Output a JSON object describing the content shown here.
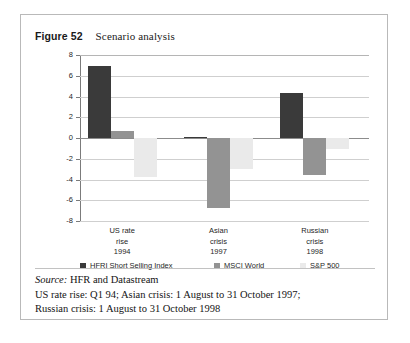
{
  "figure": {
    "label": "Figure 52",
    "title": "Scenario analysis"
  },
  "chart_data": {
    "type": "bar",
    "title": "Scenario analysis",
    "xlabel": "",
    "ylabel": "Three-month total return (%)",
    "ylim": [
      -8,
      8
    ],
    "yticks": [
      "8",
      "6",
      "4",
      "2",
      "0",
      "-2",
      "-4",
      "-6",
      "-8"
    ],
    "ytick_values": [
      8,
      6,
      4,
      2,
      0,
      -2,
      -4,
      -6,
      -8
    ],
    "grid": true,
    "legend_position": "bottom",
    "categories": [
      "US rate rise 1994",
      "Asian crisis 1997",
      "Russian crisis 1998"
    ],
    "category_lines": [
      [
        "US rate",
        "rise",
        "1994"
      ],
      [
        "Asian",
        "crisis",
        "1997"
      ],
      [
        "Russian",
        "crisis",
        "1998"
      ]
    ],
    "series": [
      {
        "name": "HFRI Short Selling Index",
        "color": "#3a3a3a",
        "values": [
          6.9,
          0.1,
          4.3
        ]
      },
      {
        "name": "MSCI World",
        "color": "#939393",
        "values": [
          0.7,
          -6.7,
          -3.6
        ]
      },
      {
        "name": "S&P 500",
        "color": "#eaeaea",
        "values": [
          -3.8,
          -3.0,
          -1.1
        ]
      }
    ]
  },
  "footer": {
    "source_word": "Source:",
    "source_text": " HFR and Datastream",
    "line2": "US rate rise: Q1 94; Asian crisis: 1 August to 31 October 1997;",
    "line3": "Russian crisis: 1 August to 31 October 1998"
  }
}
